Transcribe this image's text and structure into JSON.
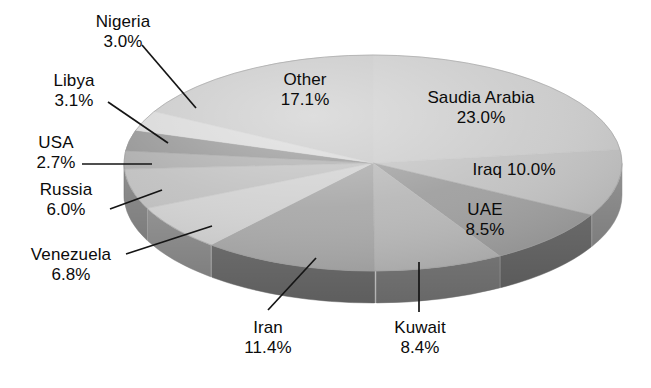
{
  "chart_data": {
    "type": "pie",
    "title": "",
    "subtitle": "",
    "xlabel": "",
    "ylabel": "",
    "units": "percent",
    "legend_position": "none",
    "grid": false,
    "style": "3d-exploded-none-grayscale",
    "categories": [
      "Saudia Arabia",
      "Iraq",
      "UAE",
      "Kuwait",
      "Iran",
      "Venezuela",
      "Russia",
      "USA",
      "Libya",
      "Nigeria",
      "Other"
    ],
    "values": [
      23.0,
      10.0,
      8.5,
      8.4,
      11.4,
      6.8,
      6.0,
      2.7,
      3.1,
      3.0,
      17.1
    ],
    "total": 100.0,
    "slices": [
      {
        "name": "Saudia Arabia",
        "value": 23.0,
        "value_text": "23.0%",
        "color": "#c9c9c9",
        "side_color": "#a8a8a8",
        "label_placement": "inside"
      },
      {
        "name": "Iraq",
        "value": 10.0,
        "value_text": "10.0%",
        "color": "#c0c0c0",
        "side_color": "#9e9e9e",
        "label_placement": "inside"
      },
      {
        "name": "UAE",
        "value": 8.5,
        "value_text": "8.5%",
        "color": "#9a9a9a",
        "side_color": "#7d7d7d",
        "label_placement": "inside"
      },
      {
        "name": "Kuwait",
        "value": 8.4,
        "value_text": "8.4%",
        "color": "#b4b4b4",
        "side_color": "#949494",
        "label_placement": "outside"
      },
      {
        "name": "Iran",
        "value": 11.4,
        "value_text": "11.4%",
        "color": "#a4a4a4",
        "side_color": "#868686",
        "label_placement": "outside"
      },
      {
        "name": "Venezuela",
        "value": 6.8,
        "value_text": "6.8%",
        "color": "#cfcfcf",
        "side_color": "#ababab",
        "label_placement": "outside"
      },
      {
        "name": "Russia",
        "value": 6.0,
        "value_text": "6.0%",
        "color": "#bdbdbd",
        "side_color": "#9b9b9b",
        "label_placement": "outside"
      },
      {
        "name": "USA",
        "value": 2.7,
        "value_text": "2.7%",
        "color": "#a9a9a9",
        "side_color": "#8b8b8b",
        "label_placement": "outside"
      },
      {
        "name": "Libya",
        "value": 3.1,
        "value_text": "3.1%",
        "color": "#8f8f8f",
        "side_color": "#757575",
        "label_placement": "outside"
      },
      {
        "name": "Nigeria",
        "value": 3.0,
        "value_text": "3.0%",
        "color": "#d6d6d6",
        "side_color": "#b0b0b0",
        "label_placement": "outside"
      },
      {
        "name": "Other",
        "value": 17.1,
        "value_text": "17.1%",
        "color": "#c6c6c6",
        "side_color": "#a3a3a3",
        "label_placement": "inside"
      }
    ]
  },
  "labels": {
    "nigeria": {
      "name": "Nigeria",
      "pct": "3.0%"
    },
    "libya": {
      "name": "Libya",
      "pct": "3.1%"
    },
    "usa": {
      "name": "USA",
      "pct": "2.7%"
    },
    "russia": {
      "name": "Russia",
      "pct": "6.0%"
    },
    "venezuela": {
      "name": "Venezuela",
      "pct": "6.8%"
    },
    "iran": {
      "name": "Iran",
      "pct": "11.4%"
    },
    "kuwait": {
      "name": "Kuwait",
      "pct": "8.4%"
    },
    "uae": {
      "name": "UAE",
      "pct": "8.5%"
    },
    "iraq": {
      "name": "Iraq",
      "pct": "10.0%"
    },
    "saudi": {
      "name": "Saudia Arabia",
      "pct": "23.0%"
    },
    "other": {
      "name": "Other",
      "pct": "17.1%"
    }
  },
  "colors": {
    "background": "#ffffff",
    "text": "#0b0b0b",
    "leader_line": "#151515",
    "rim": "#8e8e8e"
  }
}
